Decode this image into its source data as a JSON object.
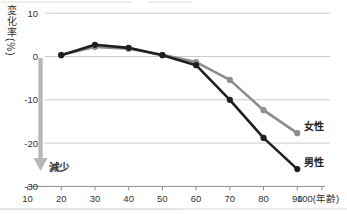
{
  "chart_data": {
    "type": "line",
    "title": "",
    "ylabel": "変化率(%)",
    "xlabel": "",
    "x_axis_unit_suffix": "(年齢)",
    "x": [
      20,
      30,
      40,
      50,
      60,
      70,
      80,
      90
    ],
    "x_ticks": [
      10,
      20,
      30,
      40,
      50,
      60,
      70,
      80,
      90,
      100
    ],
    "y_ticks": [
      10,
      0,
      -10,
      -20,
      -30
    ],
    "y_gridlines": [
      10,
      0,
      -10,
      -20
    ],
    "xlim": [
      10,
      100
    ],
    "ylim": [
      -30,
      10
    ],
    "grid": true,
    "legend_position": "end-of-line",
    "series": [
      {
        "name": "女性",
        "color": "#8d8d8d",
        "values": [
          0.4,
          2.2,
          1.8,
          0.4,
          -1.3,
          -5.4,
          -12.4,
          -17.7
        ]
      },
      {
        "name": "男性",
        "color": "#1f1f1f",
        "values": [
          0.3,
          2.7,
          2.0,
          0.3,
          -2.0,
          -10.0,
          -18.8,
          -26.0
        ]
      }
    ],
    "annotation": {
      "text": "減少",
      "text_color": "#3a3a3a",
      "arrow_color": "#b8b8b8"
    }
  },
  "colors": {
    "background": "#ffffff",
    "gridline": "#cbcbcb",
    "axis": "#8f8f8f",
    "tick_label": "#333333",
    "series_label": "#222222",
    "page_rule": "#c9c9c9",
    "page_rule_light": "#dedede"
  }
}
